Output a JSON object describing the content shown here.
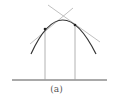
{
  "figure": {
    "caption": "(a)",
    "colors": {
      "curve": "#333333",
      "tangent": "#b0b0b0",
      "vertical": "#a0a0a0",
      "baseline": "#555555",
      "point": "#222222"
    },
    "curve": {
      "start": [
        31,
        54
      ],
      "apex": [
        62,
        20
      ],
      "end": [
        96,
        54
      ]
    },
    "points": [
      {
        "x": 45,
        "y": 29
      },
      {
        "x": 75,
        "y": 25
      }
    ],
    "tangents": [
      {
        "from": [
          30,
          44
        ],
        "to": [
          73,
          8
        ]
      },
      {
        "from": [
          48,
          5
        ],
        "to": [
          100,
          42
        ]
      }
    ],
    "verticals": [
      {
        "x": 45,
        "y1": 29,
        "y2": 80
      },
      {
        "x": 75,
        "y1": 25,
        "y2": 80
      }
    ],
    "baseline": {
      "x1": 12,
      "x2": 107,
      "y": 80
    }
  }
}
